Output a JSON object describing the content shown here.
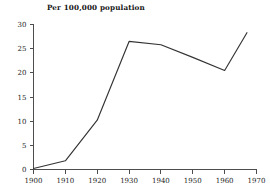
{
  "chart_data": {
    "type": "line",
    "title": "Per 100,000 population",
    "xlabel": "",
    "ylabel": "",
    "x": [
      1900,
      1910,
      1920,
      1930,
      1940,
      1950,
      1960,
      1967
    ],
    "values": [
      0.2,
      1.8,
      10.2,
      26.5,
      25.8,
      23.2,
      20.5,
      28.3
    ],
    "series": [
      {
        "name": "Per 100,000 population",
        "values": [
          0.2,
          1.8,
          10.2,
          26.5,
          25.8,
          23.2,
          20.5,
          28.3
        ]
      }
    ],
    "xlim": [
      1900,
      1970
    ],
    "ylim": [
      0,
      30
    ],
    "xticks": [
      1900,
      1910,
      1920,
      1930,
      1940,
      1950,
      1960,
      1970
    ],
    "xtick_labels": [
      "1900",
      "1910",
      "1920",
      "1930",
      "1940",
      "1950",
      "1960",
      "1970"
    ],
    "yticks": [
      0,
      5,
      10,
      15,
      20,
      25,
      30
    ],
    "ytick_labels": [
      "0",
      "5",
      "10",
      "15",
      "20",
      "25",
      "30"
    ],
    "grid": false,
    "legend": "none",
    "line_color": "#333333"
  }
}
